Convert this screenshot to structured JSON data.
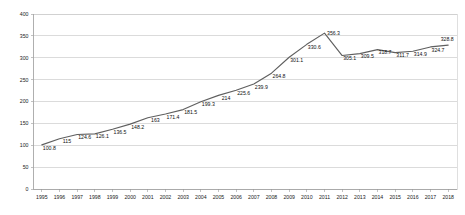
{
  "chart_data": {
    "type": "line",
    "title": "",
    "subtitle": "",
    "xlabel": "",
    "ylabel": "",
    "categories": [
      "1995",
      "1996",
      "1997",
      "1998",
      "1999",
      "2000",
      "2001",
      "2002",
      "2003",
      "2004",
      "2005",
      "2006",
      "2007",
      "2008",
      "2009",
      "2010",
      "2011",
      "2012",
      "2013",
      "2014",
      "2015",
      "2016",
      "2017",
      "2018"
    ],
    "values": [
      100.8,
      115,
      124.6,
      126.1,
      136.5,
      148.2,
      163,
      171.4,
      181.5,
      199.3,
      214,
      225.6,
      239.9,
      264.8,
      301.1,
      330.6,
      356.3,
      305.1,
      309.5,
      318.7,
      311.7,
      314.9,
      324.7,
      328.8
    ],
    "point_labels": [
      "100.8",
      "115",
      "124.6",
      "126.1",
      "136.5",
      "148.2",
      "163",
      "171.4",
      "181.5",
      "199.3",
      "214",
      "225.6",
      "239.9",
      "264.8",
      "301.1",
      "330.6",
      "356.3",
      "305.1",
      "309.5",
      "318.7",
      "311.7",
      "314.9",
      "324.7",
      "328.8"
    ],
    "series": [
      {
        "name": "",
        "color": "#5f5f5f",
        "values": [
          100.8,
          115,
          124.6,
          126.1,
          136.5,
          148.2,
          163,
          171.4,
          181.5,
          199.3,
          214,
          225.6,
          239.9,
          264.8,
          301.1,
          330.6,
          356.3,
          305.1,
          309.5,
          318.7,
          311.7,
          314.9,
          324.7,
          328.8
        ]
      }
    ],
    "ylim": [
      0,
      400
    ],
    "yticks": [
      0,
      50,
      100,
      150,
      200,
      250,
      300,
      350,
      400
    ],
    "ytick_labels": [
      "0",
      "50",
      "100",
      "150",
      "200",
      "250",
      "300",
      "350",
      "400"
    ],
    "xtick_labels": [
      "1995",
      "1996",
      "1997",
      "1998",
      "1999",
      "2000",
      "2001",
      "2002",
      "2003",
      "2004",
      "2005",
      "2006",
      "2007",
      "2008",
      "2009",
      "2010",
      "2011",
      "2012",
      "2013",
      "2014",
      "2015",
      "2016",
      "2017",
      "2018"
    ],
    "grid": true,
    "grid_axis": "y",
    "legend": false,
    "legend_position": "none",
    "data_labels_shown": true,
    "annotations": []
  },
  "colors": {
    "background": "#ffffff",
    "series_line": "#5f5f5f",
    "gridline": "#b8b8b8",
    "axis": "#9a9a9a",
    "text": "#1a1a1a",
    "plot_border": "#c9c9c9"
  }
}
